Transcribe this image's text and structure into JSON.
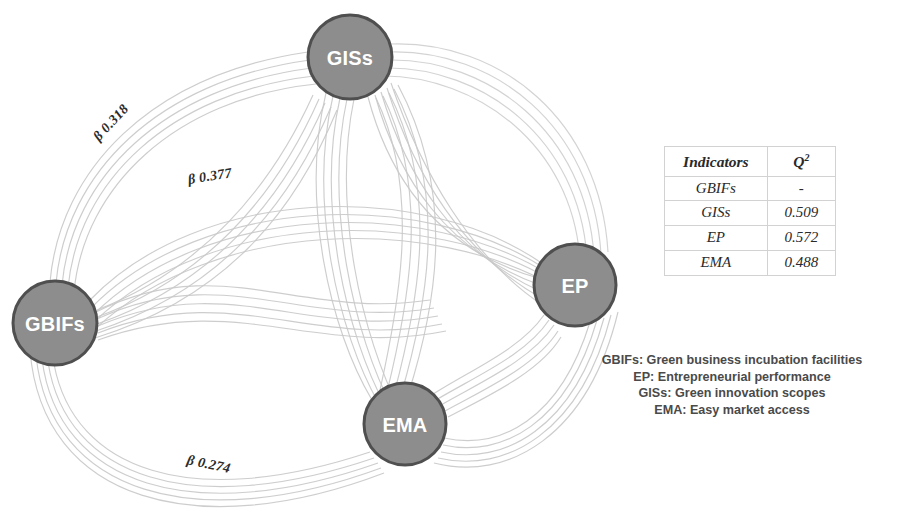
{
  "figure": {
    "type": "path-model-diagram",
    "background": "#ffffff",
    "node_fill": "#8d8d8d",
    "node_stroke": "#4f4f4f",
    "node_text_color": "#ffffff",
    "edge_color": "#c9c9c9"
  },
  "nodes": [
    {
      "id": "GISs",
      "label": "GISs",
      "cx": 350,
      "cy": 57,
      "r": 42
    },
    {
      "id": "GBIFs",
      "label": "GBIFs",
      "cx": 55,
      "cy": 323,
      "r": 42
    },
    {
      "id": "EP",
      "label": "EP",
      "cx": 575,
      "cy": 285,
      "r": 41
    },
    {
      "id": "EMA",
      "label": "EMA",
      "cx": 405,
      "cy": 424,
      "r": 41
    }
  ],
  "edge_labels": {
    "gbifs_giss": "β 0.318",
    "gbifs_ep": "β 0.377",
    "gbifs_ema": "β 0.274"
  },
  "table": {
    "headers": {
      "indicators": "Indicators",
      "q2": "Q",
      "q2_sup": "2"
    },
    "rows": [
      {
        "indicator": "GBIFs",
        "q2": "-"
      },
      {
        "indicator": "GISs",
        "q2": "0.509"
      },
      {
        "indicator": "EP",
        "q2": "0.572"
      },
      {
        "indicator": "EMA",
        "q2": "0.488"
      }
    ]
  },
  "legend": {
    "lines": [
      "GBIFs: Green business incubation facilities",
      "EP: Entrepreneurial performance",
      "GISs: Green innovation scopes",
      "EMA: Easy market access"
    ]
  }
}
